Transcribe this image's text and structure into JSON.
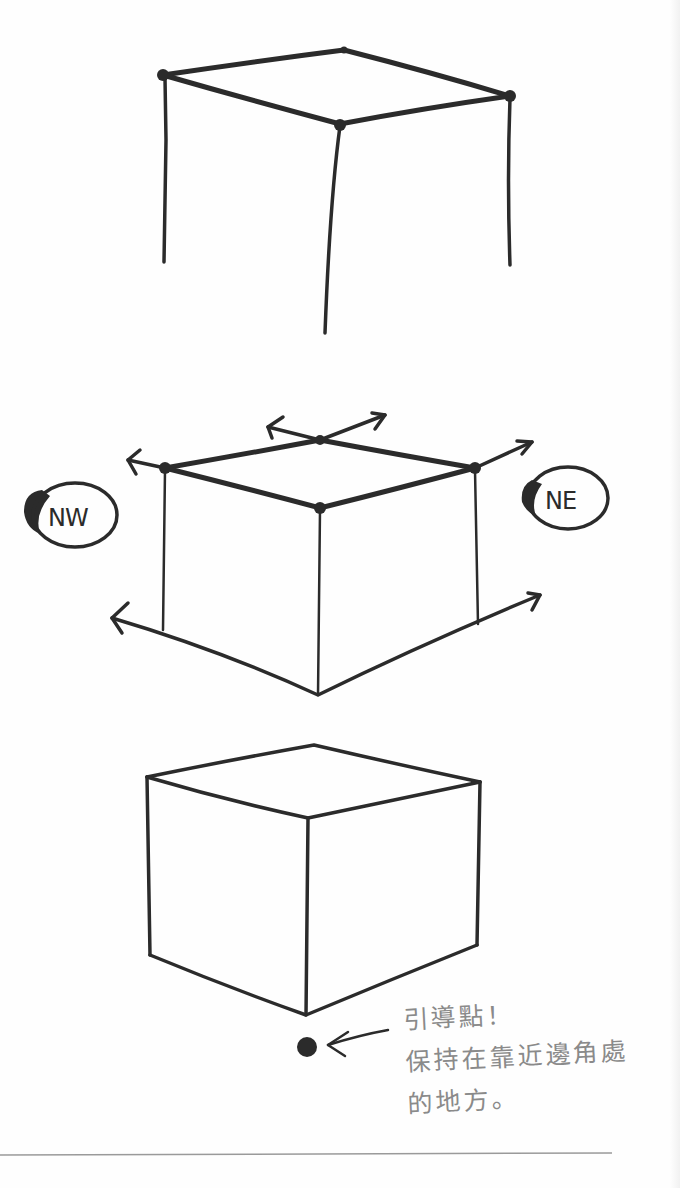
{
  "figure": {
    "steps": [
      {
        "id": 1,
        "description": "Top face with corner dots and three vertical edges"
      },
      {
        "id": 2,
        "description": "Cube with extension arrows showing vanishing directions",
        "labels": {
          "left": "NW",
          "right": "NE"
        }
      },
      {
        "id": 3,
        "description": "Finished cube with guide point below the near corner"
      }
    ],
    "annotation": {
      "line1": "引導點！",
      "line2": "保持在靠近邊角處",
      "line3": "的地方。"
    },
    "colors": {
      "ink": "#2b2b2b",
      "annotation": "#8a8a8a",
      "paper": "#fefefe",
      "rule": "#9a9a9a"
    }
  }
}
